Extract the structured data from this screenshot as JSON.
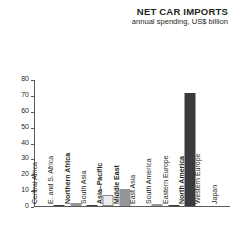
{
  "header": {
    "title": "NET CAR IMPORTS",
    "subtitle": "annual spending, US$ billion"
  },
  "colors": {
    "bar_dark": "#3b3b3d",
    "bar_mid": "#939598",
    "bar_light": "#ececec",
    "axis": "#58595b",
    "text": "#231f20"
  },
  "chart_data": {
    "type": "bar",
    "title": "NET CAR IMPORTS",
    "subtitle": "annual spending, US$ billion",
    "xlabel": "",
    "ylabel": "",
    "ylim": [
      0,
      80
    ],
    "yticks": [
      0,
      10,
      20,
      30,
      40,
      50,
      60,
      70,
      80
    ],
    "grid": false,
    "legend": false,
    "categories": [
      "Central Africa",
      "E. and S. Africa",
      "Northern Africa",
      "South Asia",
      "Asia–Pacific",
      "Middle East",
      "East Asia",
      "South America",
      "Eastern Europe",
      "North America",
      "Western Europe",
      "Japan"
    ],
    "values": [
      0,
      0.3,
      1.6,
      0.2,
      7.0,
      11.0,
      0,
      1.5,
      0.2,
      71.0,
      0,
      0
    ],
    "bar_styles": [
      "dark",
      "dark",
      "mid",
      "dark",
      "light",
      "mid",
      "dark",
      "mid",
      "dark",
      "dark",
      "dark",
      "dark"
    ],
    "label_weights": [
      "normal",
      "normal",
      "bold",
      "normal",
      "bold",
      "bold",
      "normal",
      "normal",
      "normal",
      "bold",
      "normal",
      "normal"
    ]
  }
}
